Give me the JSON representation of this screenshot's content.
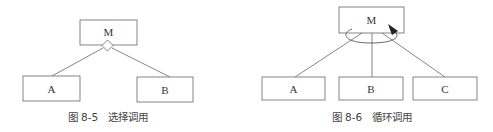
{
  "figures": [
    {
      "id": "fig-8-5",
      "caption": "图 8-5　选择调用",
      "caller": "M",
      "callees": [
        "A",
        "B"
      ],
      "connector": "diamond"
    },
    {
      "id": "fig-8-6",
      "caption": "图 8-6　循环调用",
      "caller": "M",
      "callees": [
        "A",
        "B",
        "C"
      ],
      "connector": "loop-arrow"
    }
  ],
  "colors": {
    "stroke": "#555555",
    "text": "#333333",
    "background": "#ffffff"
  }
}
